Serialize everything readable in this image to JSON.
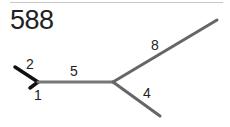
{
  "header": {
    "tree_id": "588"
  },
  "diagram": {
    "type": "unrooted-tree",
    "colors": {
      "branch": "#666666",
      "highlight_branch": "#111111",
      "rule": "#c8c8c8"
    },
    "branches": [
      {
        "label": "2",
        "from": [
          38,
          82
        ],
        "to": [
          15,
          67
        ],
        "color": "#111111"
      },
      {
        "label": "1",
        "from": [
          38,
          82
        ],
        "to": [
          30,
          88
        ],
        "color": "#111111"
      },
      {
        "label": "5",
        "from": [
          38,
          82
        ],
        "to": [
          113,
          82
        ],
        "color": "#666666"
      },
      {
        "label": "8",
        "from": [
          113,
          82
        ],
        "to": [
          217,
          20
        ],
        "color": "#666666"
      },
      {
        "label": "4",
        "from": [
          113,
          82
        ],
        "to": [
          160,
          116
        ],
        "color": "#666666"
      }
    ]
  }
}
